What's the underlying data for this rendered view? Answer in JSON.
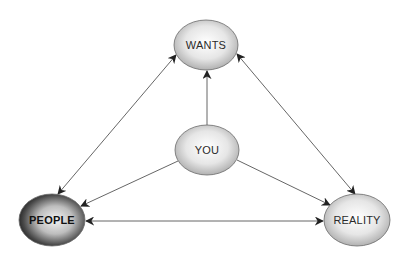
{
  "diagram": {
    "type": "relationship-triangle",
    "nodes": [
      {
        "id": "wants",
        "label": "WANTS",
        "cx": 206,
        "cy": 45,
        "rx": 32,
        "ry": 25,
        "style": "light"
      },
      {
        "id": "you",
        "label": "YOU",
        "cx": 207,
        "cy": 150,
        "rx": 32,
        "ry": 25,
        "style": "light"
      },
      {
        "id": "people",
        "label": "PEOPLE",
        "cx": 52,
        "cy": 220,
        "rx": 33,
        "ry": 26,
        "style": "dark"
      },
      {
        "id": "reality",
        "label": "REALITY",
        "cx": 357,
        "cy": 220,
        "rx": 33,
        "ry": 26,
        "style": "light"
      }
    ],
    "edges": [
      {
        "from": "you",
        "to": "wants",
        "direction": "one-way"
      },
      {
        "from": "you",
        "to": "people",
        "direction": "one-way"
      },
      {
        "from": "you",
        "to": "reality",
        "direction": "one-way"
      },
      {
        "from": "wants",
        "to": "people",
        "direction": "two-way"
      },
      {
        "from": "wants",
        "to": "reality",
        "direction": "two-way"
      },
      {
        "from": "people",
        "to": "reality",
        "direction": "two-way"
      }
    ],
    "colors": {
      "light_fill_center": "#ffffff",
      "light_fill_edge": "#a9a9a9",
      "dark_fill_center": "#f2f2f2",
      "dark_fill_edge": "#1a1a1a",
      "edge": "#555555",
      "text": "#2a2a2a"
    }
  },
  "labels": {
    "wants": "WANTS",
    "you": "YOU",
    "people": "PEOPLE",
    "reality": "REALITY"
  }
}
